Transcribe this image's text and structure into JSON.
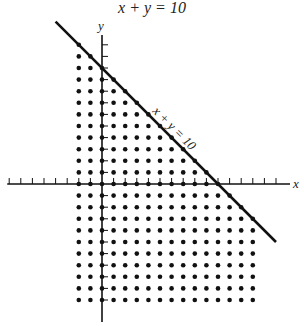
{
  "title": "x + y = 10",
  "chart_data": {
    "type": "scatter",
    "title": "x + y = 10",
    "line": {
      "equation": "x + y = 10",
      "label": "x + y = 10",
      "x_intercept": 10,
      "y_intercept": 10
    },
    "point_region": {
      "x_min": -2,
      "x_max": 13,
      "y_min": -10,
      "y_max": 12,
      "inequality": "x + y <= 10"
    },
    "xlabel": "x",
    "ylabel": "y",
    "x_ticks": [
      -8,
      -7,
      -6,
      -5,
      -4,
      -3,
      -2,
      -1,
      1,
      2,
      3,
      4,
      5,
      6,
      7,
      8,
      9,
      10,
      11,
      12,
      13,
      14,
      15
    ],
    "y_ticks": [
      -10,
      -9,
      -8,
      -7,
      -6,
      -5,
      -4,
      -3,
      -2,
      -1,
      1,
      2,
      3,
      4,
      5,
      6,
      7,
      8,
      9,
      10,
      11,
      12
    ],
    "xlim": [
      -8,
      16
    ],
    "ylim": [
      -11.5,
      13
    ],
    "grid": false,
    "colors": {
      "ink": "#111111",
      "line": "#111111"
    }
  },
  "geom": {
    "ox": 102,
    "oy": 184,
    "unit": 11.6
  }
}
